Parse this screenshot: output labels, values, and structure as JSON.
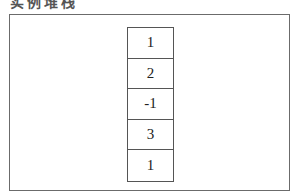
{
  "caption": "实例堆栈",
  "stack": {
    "cells": [
      "1",
      "2",
      "-1",
      "3",
      "1"
    ]
  }
}
